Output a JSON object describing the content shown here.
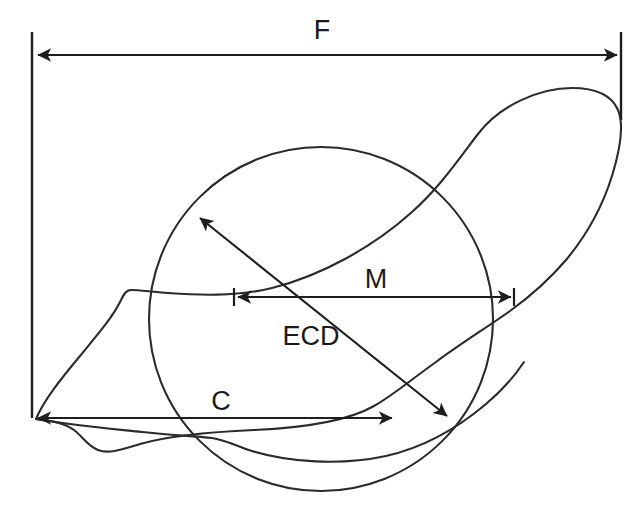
{
  "diagram": {
    "background_color": "#ffffff",
    "line_color": "#2b2b2b",
    "text_color": "#1a1a1a",
    "labels": {
      "feret": "F",
      "martin": "M",
      "chord": "C",
      "ecd": "ECD"
    },
    "measures": [
      {
        "key": "feret",
        "label": "F",
        "name": "feret-diameter",
        "arrow_style": "double",
        "x1": 36,
        "y1": 55,
        "x2": 619,
        "y2": 55,
        "label_x": 322,
        "label_y": 39
      },
      {
        "key": "martin",
        "label": "M",
        "name": "martin-diameter",
        "arrow_style": "double",
        "x1": 237,
        "y1": 297,
        "x2": 512,
        "y2": 297,
        "label_x": 376,
        "label_y": 288
      },
      {
        "key": "chord",
        "label": "C",
        "name": "chord-diameter",
        "arrow_style": "double",
        "x1": 36,
        "y1": 418,
        "x2": 394,
        "y2": 418,
        "label_x": 221,
        "label_y": 410
      },
      {
        "key": "ecd",
        "label": "ECD",
        "name": "equivalent-circle-diameter",
        "arrow_style": "double",
        "x1": 198,
        "y1": 216,
        "x2": 449,
        "y2": 418,
        "label_x": 311,
        "label_y": 345
      }
    ],
    "circle": {
      "name": "equivalent-circle",
      "cx": 321,
      "cy": 319,
      "r": 172
    },
    "extension_lines": [
      {
        "name": "extension-line-left-top",
        "x1": 32,
        "y1": 32,
        "x2": 32,
        "y2": 120
      },
      {
        "name": "extension-line-right-top",
        "x1": 621,
        "y1": 32,
        "x2": 621,
        "y2": 120
      },
      {
        "name": "extension-line-left-bottom",
        "x1": 32,
        "y1": 120,
        "x2": 32,
        "y2": 418
      }
    ],
    "tick_marks": [
      {
        "name": "martin-tick-left",
        "x": 234,
        "y1": 288,
        "y2": 306
      },
      {
        "name": "martin-tick-right",
        "x": 514,
        "y1": 288,
        "y2": 306
      }
    ]
  }
}
